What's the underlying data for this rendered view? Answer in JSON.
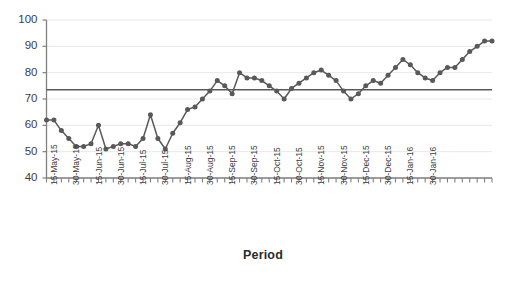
{
  "chart_data": {
    "type": "line",
    "title": "",
    "subtitle": "",
    "xlabel": "Period",
    "ylabel": "",
    "ylim": [
      40,
      100
    ],
    "ytick_step": 10,
    "yticks": [
      40,
      50,
      60,
      70,
      80,
      90,
      100
    ],
    "grid": true,
    "grid_axis": "y",
    "legend": "none",
    "marker": "circle",
    "series_color": "#595959",
    "grid_color": "#e8e8e8",
    "axis_color": "#808080",
    "reference_line": {
      "label": "",
      "value": 73.5,
      "color": "#595959",
      "orientation": "horizontal"
    },
    "x_tick_labels": [
      "15-May-15",
      "30-May-15",
      "15-Jun-15",
      "30-Jun-15",
      "15-Jul-15",
      "30-Jul-15",
      "15-Aug-15",
      "30-Aug-15",
      "15-Sep-15",
      "30-Sep-15",
      "15-Oct-15",
      "30-Oct-15",
      "15-Nov-15",
      "30-Nov-15",
      "15-Dec-15",
      "30-Dec-15",
      "15-Jan-16",
      "30-Jan-16"
    ],
    "x_label_interval": 3,
    "x": [
      0,
      1,
      2,
      3,
      4,
      5,
      6,
      7,
      8,
      9,
      10,
      11,
      12,
      13,
      14,
      15,
      16,
      17,
      18,
      19,
      20,
      21,
      22,
      23,
      24,
      25,
      26,
      27,
      28,
      29,
      30,
      31,
      32,
      33,
      34,
      35,
      36,
      37,
      38,
      39,
      40,
      41,
      42,
      43,
      44,
      45,
      46,
      47,
      48,
      49,
      50,
      51,
      52,
      53,
      54,
      55,
      56,
      57,
      58,
      59,
      60
    ],
    "values": [
      62,
      62,
      58,
      55,
      52,
      52,
      53,
      60,
      51,
      52,
      53,
      53,
      52,
      55,
      64,
      55,
      51,
      57,
      61,
      66,
      67,
      70,
      73,
      77,
      75,
      72,
      80,
      78,
      78,
      77,
      75,
      73,
      70,
      74,
      76,
      78,
      80,
      81,
      79,
      77,
      73,
      70,
      72,
      75,
      77,
      76,
      79,
      82,
      85,
      83,
      80,
      78,
      77,
      80,
      82,
      82,
      85,
      88,
      90,
      92,
      92
    ]
  }
}
